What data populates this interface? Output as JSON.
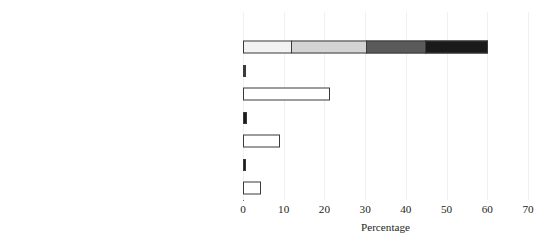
{
  "chart_data": {
    "type": "bar",
    "orientation": "horizontal",
    "stacked": true,
    "title": "",
    "xlabel": "Percentage",
    "ylabel": "",
    "xlim": [
      0,
      70
    ],
    "xticks": [
      0,
      10,
      20,
      30,
      40,
      50,
      60,
      70
    ],
    "xtick_labels": [
      "0",
      "10",
      "20",
      "30",
      "40",
      "50",
      "60",
      "70"
    ],
    "grid": "vertical-faint",
    "legend": "none",
    "categories": [
      "Small (<1000 km²) - International",
      "National",
      "Medium (>1000 - 10,000 km²) - International",
      "National",
      "Large (>10,000 - 100,000 km²) - International",
      "National",
      "Very large (>100,000 km²) - International",
      "National"
    ],
    "values": [
      0,
      61.0,
      0.5,
      21.4,
      0.9,
      9.0,
      0.8,
      4.4
    ],
    "rows": [
      {
        "label_main": "Small (<1000 km",
        "label_sup": "2",
        "label_tail": ") - International",
        "total": 0,
        "segments": []
      },
      {
        "label_main": "National",
        "label_sup": "",
        "label_tail": "",
        "total": 61.0,
        "segments": [
          {
            "value": 12.0,
            "color": "#f2f2f2"
          },
          {
            "value": 18.7,
            "color": "#d4d4d4"
          },
          {
            "value": 14.8,
            "color": "#5a5a5a"
          },
          {
            "value": 15.5,
            "color": "#1a1a1a"
          }
        ]
      },
      {
        "label_main": "Medium (>1000 - 10,000 km",
        "label_sup": "2",
        "label_tail": ") - International",
        "total": 0.5,
        "segments": [
          {
            "value": 0.5,
            "color": "#3a3a3a"
          }
        ]
      },
      {
        "label_main": "National",
        "label_sup": "",
        "label_tail": "",
        "total": 21.4,
        "segments": [
          {
            "value": 21.4,
            "color": "#ffffff"
          }
        ]
      },
      {
        "label_main": "Large (>10,000 - 100,000 km",
        "label_sup": "2",
        "label_tail": ") - International",
        "total": 0.9,
        "segments": [
          {
            "value": 0.9,
            "color": "#1a1a1a"
          }
        ]
      },
      {
        "label_main": "National",
        "label_sup": "",
        "label_tail": "",
        "total": 9.0,
        "segments": [
          {
            "value": 9.0,
            "color": "#ffffff"
          }
        ]
      },
      {
        "label_main": "Very large (>100,000 km",
        "label_sup": "2",
        "label_tail": ") - International",
        "total": 0.8,
        "segments": [
          {
            "value": 0.8,
            "color": "#1a1a1a"
          }
        ]
      },
      {
        "label_main": "National",
        "label_sup": "",
        "label_tail": "",
        "total": 4.4,
        "segments": [
          {
            "value": 4.4,
            "color": "#ffffff"
          }
        ]
      }
    ],
    "colors": {
      "segment_1": "#f2f2f2",
      "segment_2": "#d4d4d4",
      "segment_3": "#5a5a5a",
      "segment_4": "#1a1a1a",
      "outline": "#3a3a3a",
      "axis": "#6d6d6d",
      "gridline": "#f0f0f0",
      "text": "#231f20",
      "background": "#ffffff"
    }
  }
}
